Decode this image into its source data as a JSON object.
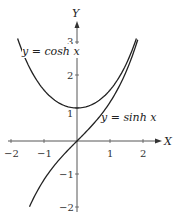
{
  "chart_data": {
    "type": "line",
    "title": "",
    "xlabel": "X",
    "ylabel": "Y",
    "xlim": [
      -2.1,
      2.4
    ],
    "ylim": [
      -2.1,
      3.5
    ],
    "grid": false,
    "x_ticks": [
      "-2",
      "-1",
      "1",
      "2"
    ],
    "y_ticks": [
      "3",
      "2",
      "1",
      "-1",
      "-2"
    ],
    "series": [
      {
        "name": "y = cosh x",
        "x": [
          -1.8,
          -1.5,
          -1.0,
          -0.5,
          0,
          0.5,
          1.0,
          1.5,
          1.8
        ],
        "values": [
          3.11,
          2.35,
          1.54,
          1.13,
          1.0,
          1.13,
          1.54,
          2.35,
          3.11
        ]
      },
      {
        "name": "y = sinh x",
        "x": [
          -1.44,
          -1.0,
          -0.5,
          0,
          0.5,
          1.0,
          1.5,
          1.82
        ],
        "values": [
          -2.0,
          -1.18,
          -0.52,
          0,
          0.52,
          1.18,
          2.13,
          3.0
        ]
      }
    ],
    "annotations": [
      "y = cosh x",
      "y = sinh x"
    ]
  },
  "labels": {
    "x_axis": "X",
    "y_axis": "Y",
    "cosh": "y = cosh x",
    "sinh": "y = sinh x",
    "xt_m2": "−2",
    "xt_m1": "−1",
    "xt_1": "1",
    "xt_2": "2",
    "yt_3": "3",
    "yt_2": "2",
    "yt_1": "1",
    "yt_m1": "−1",
    "yt_m2": "−2"
  }
}
